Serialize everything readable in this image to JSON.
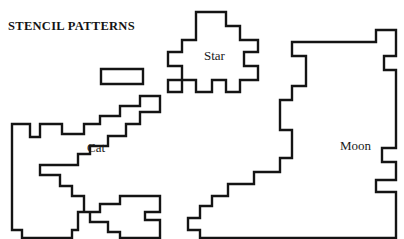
{
  "page": {
    "title": "STENCIL PATTERNS",
    "background_color": "#ffffff",
    "stroke_color": "#141414",
    "fill_color": "#ffffff",
    "stroke_width": 2.4,
    "width": 404,
    "height": 239
  },
  "shapes": [
    {
      "name": "cat",
      "label": "Cat",
      "label_x": 87,
      "label_y": 140,
      "style": "stepped-outline-polygon",
      "points": "12,125 12,230 22,230 22,238 72,238 72,230 78,230 78,212 90,212 90,222 108,222 108,232 120,232 120,238 160,238 160,220 145,220 145,212 160,212 160,196 120,196 120,204 100,204 100,212 84,212 84,196 72,196 72,186 60,186 60,175 40,175 40,165 78,165 78,154 90,154 90,146 108,146 108,136 126,136 126,124 140,124 140,112 160,112 160,96 140,96 140,106 120,106 120,116 100,116 100,124 84,124 84,134 62,134 62,124 40,124 40,137 30,137 30,124 12,124"
    },
    {
      "name": "cat-rectangle",
      "label": "",
      "style": "rectangle",
      "points": "101,69 143,69 143,84 101,84"
    },
    {
      "name": "star",
      "label": "Star",
      "label_x": 204,
      "label_y": 48,
      "style": "stepped-outline-polygon",
      "points": "196,12 226,12 226,26 240,26 240,40 258,40 258,52 244,52 244,66 258,66 258,80 240,80 240,92 226,92 226,80 212,80 212,92 196,92 196,80 182,80 182,92 168,92 168,80 182,80 182,66 168,66 168,52 182,52 182,40 196,40"
    },
    {
      "name": "moon",
      "label": "Moon",
      "label_x": 340,
      "label_y": 138,
      "style": "stepped-outline-polygon",
      "points": "306,42 376,42 376,30 396,30 396,56 384,56 384,70 396,70 396,148 382,148 382,162 396,162 396,180 376,180 376,192 396,192 396,238 200,238 200,230 188,230 188,218 200,218 200,206 212,206 212,196 228,196 228,184 254,184 254,172 280,172 280,158 292,158 292,130 280,130 280,100 292,100 292,86 306,86 306,56 292,56 292,42"
    }
  ]
}
